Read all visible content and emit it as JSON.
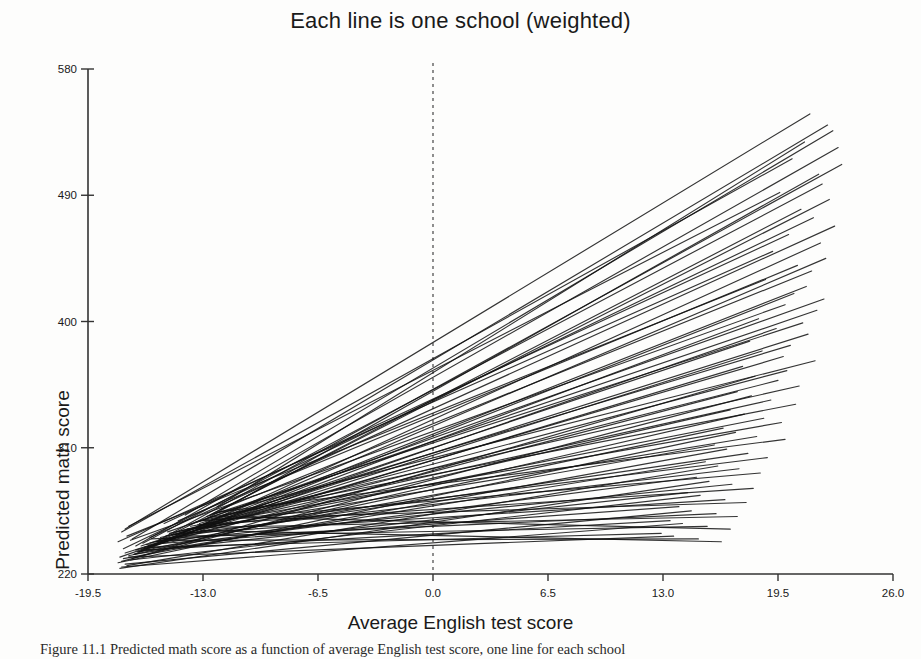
{
  "chart_data": {
    "type": "line",
    "title": "Each line is one school (weighted)",
    "xlabel": "Average English test score",
    "ylabel": "Predicted math score",
    "xlim": [
      -19.5,
      26.0
    ],
    "ylim": [
      220,
      580
    ],
    "xticks": [
      "-19.5",
      "-13.0",
      "-6.5",
      "0.0",
      "6.5",
      "13.0",
      "19.5",
      "26.0"
    ],
    "xtick_values": [
      -19.5,
      -13.0,
      -6.5,
      0.0,
      6.5,
      13.0,
      19.5,
      26.0
    ],
    "yticks": [
      "220",
      "310",
      "400",
      "490",
      "580"
    ],
    "ytick_values": [
      220,
      310,
      400,
      490,
      580
    ],
    "grid": false,
    "legend": "none",
    "annotations": [
      {
        "name": "zero-reference-line",
        "type": "vline",
        "x": 0.0,
        "style": "dashed"
      }
    ],
    "series": [
      {
        "name": "school-1",
        "x": [
          -17.4,
          21.3
        ],
        "y": [
          252,
          548
        ]
      },
      {
        "name": "school-2",
        "x": [
          -17.0,
          22.3
        ],
        "y": [
          245,
          540
        ]
      },
      {
        "name": "school-3",
        "x": [
          -14.0,
          22.6
        ],
        "y": [
          262,
          536
        ]
      },
      {
        "name": "school-4",
        "x": [
          -12.2,
          21.0
        ],
        "y": [
          268,
          528
        ]
      },
      {
        "name": "school-5",
        "x": [
          -16.8,
          22.9
        ],
        "y": [
          240,
          524
        ]
      },
      {
        "name": "school-6",
        "x": [
          -17.6,
          20.3
        ],
        "y": [
          250,
          516
        ]
      },
      {
        "name": "school-7",
        "x": [
          -15.5,
          23.1
        ],
        "y": [
          244,
          512
        ]
      },
      {
        "name": "school-8",
        "x": [
          -13.0,
          21.8
        ],
        "y": [
          258,
          505
        ]
      },
      {
        "name": "school-9",
        "x": [
          -16.4,
          22.0
        ],
        "y": [
          242,
          498
        ]
      },
      {
        "name": "school-10",
        "x": [
          -17.2,
          19.6
        ],
        "y": [
          254,
          492
        ]
      },
      {
        "name": "school-11",
        "x": [
          -14.8,
          22.4
        ],
        "y": [
          248,
          487
        ]
      },
      {
        "name": "school-12",
        "x": [
          -12.6,
          20.8
        ],
        "y": [
          262,
          480
        ]
      },
      {
        "name": "school-13",
        "x": [
          -17.5,
          21.5
        ],
        "y": [
          238,
          474
        ]
      },
      {
        "name": "school-14",
        "x": [
          -16.0,
          22.7
        ],
        "y": [
          246,
          468
        ]
      },
      {
        "name": "school-15",
        "x": [
          -15.2,
          20.1
        ],
        "y": [
          256,
          462
        ]
      },
      {
        "name": "school-16",
        "x": [
          -13.6,
          21.9
        ],
        "y": [
          252,
          456
        ]
      },
      {
        "name": "school-17",
        "x": [
          -17.8,
          19.2
        ],
        "y": [
          243,
          450
        ]
      },
      {
        "name": "school-18",
        "x": [
          -16.6,
          22.2
        ],
        "y": [
          236,
          445
        ]
      },
      {
        "name": "school-19",
        "x": [
          -14.4,
          20.6
        ],
        "y": [
          258,
          440
        ]
      },
      {
        "name": "school-20",
        "x": [
          -12.0,
          21.4
        ],
        "y": [
          266,
          436
        ]
      },
      {
        "name": "school-21",
        "x": [
          -17.3,
          18.8
        ],
        "y": [
          247,
          430
        ]
      },
      {
        "name": "school-22",
        "x": [
          -15.8,
          21.1
        ],
        "y": [
          241,
          425
        ]
      },
      {
        "name": "school-23",
        "x": [
          -16.9,
          20.4
        ],
        "y": [
          234,
          420
        ]
      },
      {
        "name": "school-24",
        "x": [
          -13.8,
          22.1
        ],
        "y": [
          255,
          416
        ]
      },
      {
        "name": "school-25",
        "x": [
          -17.1,
          19.9
        ],
        "y": [
          244,
          412
        ]
      },
      {
        "name": "school-26",
        "x": [
          -15.0,
          21.7
        ],
        "y": [
          250,
          408
        ]
      },
      {
        "name": "school-27",
        "x": [
          -16.2,
          18.4
        ],
        "y": [
          238,
          402
        ]
      },
      {
        "name": "school-28",
        "x": [
          -12.8,
          20.9
        ],
        "y": [
          261,
          399
        ]
      },
      {
        "name": "school-29",
        "x": [
          -17.7,
          19.4
        ],
        "y": [
          232,
          395
        ]
      },
      {
        "name": "school-30",
        "x": [
          -14.6,
          21.2
        ],
        "y": [
          248,
          391
        ]
      },
      {
        "name": "school-31",
        "x": [
          -16.5,
          17.9
        ],
        "y": [
          240,
          386
        ]
      },
      {
        "name": "school-32",
        "x": [
          -13.2,
          20.2
        ],
        "y": [
          256,
          383
        ]
      },
      {
        "name": "school-33",
        "x": [
          -17.4,
          18.6
        ],
        "y": [
          235,
          379
        ]
      },
      {
        "name": "school-34",
        "x": [
          -15.6,
          19.8
        ],
        "y": [
          243,
          375
        ]
      },
      {
        "name": "school-35",
        "x": [
          -12.4,
          21.6
        ],
        "y": [
          263,
          372
        ]
      },
      {
        "name": "school-36",
        "x": [
          -16.8,
          17.5
        ],
        "y": [
          237,
          368
        ]
      },
      {
        "name": "school-37",
        "x": [
          -14.2,
          20.0
        ],
        "y": [
          251,
          365
        ]
      },
      {
        "name": "school-38",
        "x": [
          -17.0,
          18.2
        ],
        "y": [
          231,
          361
        ]
      },
      {
        "name": "school-39",
        "x": [
          -15.4,
          19.5
        ],
        "y": [
          246,
          358
        ]
      },
      {
        "name": "school-40",
        "x": [
          -13.4,
          20.7
        ],
        "y": [
          257,
          354
        ]
      },
      {
        "name": "school-41",
        "x": [
          -16.3,
          17.2
        ],
        "y": [
          239,
          350
        ]
      },
      {
        "name": "school-42",
        "x": [
          -17.6,
          18.0
        ],
        "y": [
          229,
          347
        ]
      },
      {
        "name": "school-43",
        "x": [
          -14.9,
          19.1
        ],
        "y": [
          249,
          344
        ]
      },
      {
        "name": "school-44",
        "x": [
          -12.7,
          20.5
        ],
        "y": [
          260,
          341
        ]
      },
      {
        "name": "school-45",
        "x": [
          -16.0,
          16.8
        ],
        "y": [
          242,
          337
        ]
      },
      {
        "name": "school-46",
        "x": [
          -17.2,
          17.6
        ],
        "y": [
          233,
          334
        ]
      },
      {
        "name": "school-47",
        "x": [
          -15.1,
          18.7
        ],
        "y": [
          247,
          331
        ]
      },
      {
        "name": "school-48",
        "x": [
          -13.7,
          19.7
        ],
        "y": [
          254,
          328
        ]
      },
      {
        "name": "school-49",
        "x": [
          -16.6,
          16.4
        ],
        "y": [
          236,
          324
        ]
      },
      {
        "name": "school-50",
        "x": [
          -17.8,
          17.1
        ],
        "y": [
          228,
          321
        ]
      },
      {
        "name": "school-51",
        "x": [
          -14.5,
          18.3
        ],
        "y": [
          250,
          318
        ]
      },
      {
        "name": "school-52",
        "x": [
          -12.2,
          19.9
        ],
        "y": [
          264,
          316
        ]
      },
      {
        "name": "school-53",
        "x": [
          -16.1,
          15.9
        ],
        "y": [
          240,
          312
        ]
      },
      {
        "name": "school-54",
        "x": [
          -17.5,
          16.6
        ],
        "y": [
          231,
          309
        ]
      },
      {
        "name": "school-55",
        "x": [
          -15.3,
          17.8
        ],
        "y": [
          245,
          306
        ]
      },
      {
        "name": "school-56",
        "x": [
          -13.9,
          18.9
        ],
        "y": [
          252,
          303
        ]
      },
      {
        "name": "school-57",
        "x": [
          -16.9,
          15.4
        ],
        "y": [
          234,
          300
        ]
      },
      {
        "name": "school-58",
        "x": [
          -17.3,
          16.1
        ],
        "y": [
          226,
          297
        ]
      },
      {
        "name": "school-59",
        "x": [
          -14.7,
          17.3
        ],
        "y": [
          248,
          295
        ]
      },
      {
        "name": "school-60",
        "x": [
          -12.9,
          18.5
        ],
        "y": [
          258,
          292
        ]
      },
      {
        "name": "school-61",
        "x": [
          -16.4,
          14.9
        ],
        "y": [
          238,
          289
        ]
      },
      {
        "name": "school-62",
        "x": [
          -17.7,
          15.6
        ],
        "y": [
          224,
          286
        ]
      },
      {
        "name": "school-63",
        "x": [
          -15.7,
          16.9
        ],
        "y": [
          243,
          284
        ]
      },
      {
        "name": "school-64",
        "x": [
          -13.3,
          18.1
        ],
        "y": [
          255,
          281
        ]
      },
      {
        "name": "school-65",
        "x": [
          -16.7,
          14.4
        ],
        "y": [
          236,
          278
        ]
      },
      {
        "name": "school-66",
        "x": [
          -17.1,
          15.1
        ],
        "y": [
          230,
          276
        ]
      },
      {
        "name": "school-67",
        "x": [
          -14.1,
          16.5
        ],
        "y": [
          249,
          273
        ]
      },
      {
        "name": "school-68",
        "x": [
          -12.5,
          17.7
        ],
        "y": [
          259,
          271
        ]
      },
      {
        "name": "school-69",
        "x": [
          -16.2,
          13.9
        ],
        "y": [
          241,
          268
        ]
      },
      {
        "name": "school-70",
        "x": [
          -17.4,
          14.6
        ],
        "y": [
          227,
          265
        ]
      },
      {
        "name": "school-71",
        "x": [
          -15.9,
          16.0
        ],
        "y": [
          245,
          263
        ]
      },
      {
        "name": "school-72",
        "x": [
          -13.5,
          17.2
        ],
        "y": [
          253,
          261
        ]
      },
      {
        "name": "school-73",
        "x": [
          -16.5,
          13.4
        ],
        "y": [
          237,
          258
        ]
      },
      {
        "name": "school-74",
        "x": [
          -17.6,
          14.1
        ],
        "y": [
          225,
          256
        ]
      },
      {
        "name": "school-75",
        "x": [
          -14.3,
          15.5
        ],
        "y": [
          247,
          254
        ]
      },
      {
        "name": "school-76",
        "x": [
          -12.1,
          16.8
        ],
        "y": [
          261,
          252
        ]
      },
      {
        "name": "school-77",
        "x": [
          -16.0,
          12.9
        ],
        "y": [
          239,
          249
        ]
      },
      {
        "name": "school-78",
        "x": [
          -17.2,
          13.6
        ],
        "y": [
          232,
          247
        ]
      },
      {
        "name": "school-79",
        "x": [
          -15.5,
          15.0
        ],
        "y": [
          244,
          245
        ]
      },
      {
        "name": "school-80",
        "x": [
          -13.1,
          16.3
        ],
        "y": [
          251,
          243
        ]
      }
    ]
  },
  "caption": {
    "text": "Figure 11.1 Predicted math score as a function of average English test score, one line for each school"
  }
}
